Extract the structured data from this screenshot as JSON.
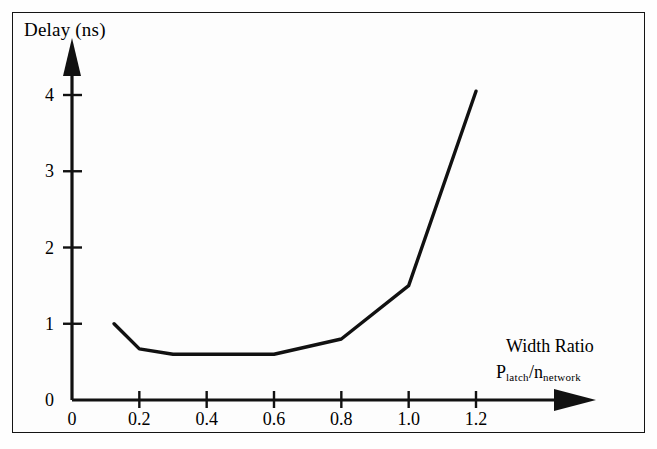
{
  "figure": {
    "y_axis_label": "Delay (ns)",
    "x_axis_title": "Width Ratio",
    "x_axis_subtitle_num": "P",
    "x_axis_subtitle_num_sub": "latch",
    "x_axis_subtitle_slash": "/",
    "x_axis_subtitle_den": "n",
    "x_axis_subtitle_den_sub": "network",
    "line_color": "#111111",
    "axis_color": "#111111",
    "frame_color": "#141414"
  },
  "chart_data": {
    "type": "line",
    "title": "",
    "xlabel": "Width Ratio  P_latch/n_network",
    "ylabel": "Delay (ns)",
    "xlim": [
      0,
      1.3
    ],
    "ylim": [
      0,
      4.4
    ],
    "grid": false,
    "legend": null,
    "xticks": [
      0,
      0.2,
      0.4,
      0.6,
      0.8,
      1.0,
      1.2
    ],
    "xticklabels": [
      "0",
      "0.2",
      "0.4",
      "0.6",
      "0.8",
      "1.0",
      "1.2"
    ],
    "yticks": [
      0,
      1,
      2,
      3,
      4
    ],
    "yticklabels": [
      "0",
      "1",
      "2",
      "3",
      "4"
    ],
    "series": [
      {
        "name": "delay",
        "x": [
          0.125,
          0.2,
          0.3,
          0.6,
          0.8,
          1.0,
          1.2
        ],
        "y": [
          1.0,
          0.67,
          0.6,
          0.6,
          0.8,
          1.5,
          4.05
        ]
      }
    ]
  }
}
